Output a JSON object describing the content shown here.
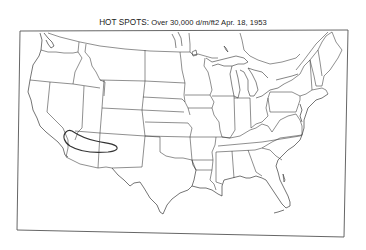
{
  "map": {
    "title_prefix": "HOT SPOTS:",
    "title_rest": " Over 30,000 d/m/ft2  Apr. 18, 1953",
    "region": "Contiguous United States (state boundaries)",
    "date": "Apr. 18, 1953",
    "threshold": "Over 30,000 d/m/ft2",
    "hot_spots": [
      {
        "label": "Southwest hot spot",
        "area": "Southern Nevada / Arizona / New Mexico corridor"
      }
    ],
    "colors": {
      "line": "#333333",
      "background": "#ffffff"
    }
  }
}
